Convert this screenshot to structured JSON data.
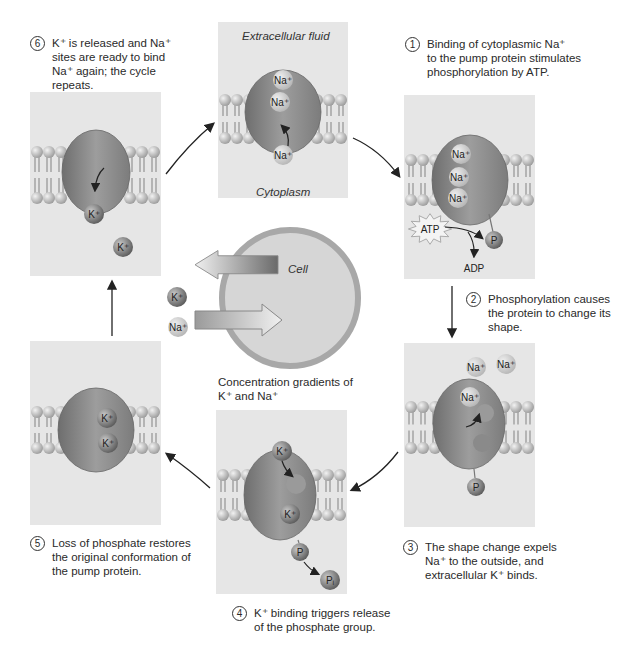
{
  "panel_labels": {
    "extracellular": "Extracellular fluid",
    "cytoplasm": "Cytoplasm",
    "cell": "Cell"
  },
  "steps": [
    {
      "number": "1",
      "text": "Binding of cytoplasmic Na⁺\nto the pump protein stimulates\nphosphorylation by ATP."
    },
    {
      "number": "2",
      "text": "Phosphorylation causes\nthe protein to change its\nshape."
    },
    {
      "number": "3",
      "text": "The shape change expels\nNa⁺ to the outside, and\nextracellular K⁺ binds."
    },
    {
      "number": "4",
      "text": "K⁺ binding triggers release\nof the phosphate group."
    },
    {
      "number": "5",
      "text": "Loss of phosphate restores\nthe original conformation of\nthe pump protein."
    },
    {
      "number": "6",
      "text": "K⁺ is released and Na⁺\nsites are ready to bind\nNa⁺ again; the cycle\nrepeats."
    }
  ],
  "gradient_caption": "Concentration gradients of\nK⁺ and Na⁺",
  "ions": {
    "na": "Na⁺",
    "k": "K⁺",
    "p": "P",
    "pi": "Pᵢ",
    "atp": "ATP",
    "adp": "ADP"
  },
  "colors": {
    "panel_bg": "#e6e6e6",
    "membrane_head": "#b8b8b8",
    "protein": "#8a8a8a",
    "na_ion": "#cfcfcf",
    "k_ion": "#7a7a7a",
    "arrow": "#222222",
    "cell_ring": "#a8a8a8"
  }
}
